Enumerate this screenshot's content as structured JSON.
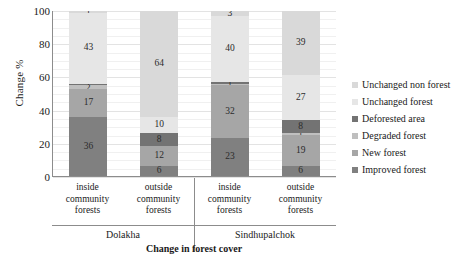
{
  "chart_data": {
    "type": "bar",
    "title": "",
    "xlabel": "Change in forest cover",
    "ylabel": "Change %",
    "ylim": [
      0,
      100
    ],
    "yticks": [
      0,
      20,
      40,
      60,
      80,
      100
    ],
    "grid": true,
    "stacked": true,
    "legend_position": "right",
    "categories": [
      "inside community forests",
      "outside community forests",
      "inside community forests",
      "outside community forests"
    ],
    "category_lines": [
      [
        "inside",
        "community",
        "forests"
      ],
      [
        "outside",
        "community",
        "forests"
      ],
      [
        "inside",
        "community",
        "forests"
      ],
      [
        "outside",
        "community",
        "forests"
      ]
    ],
    "groups": [
      {
        "label": "Dolakha",
        "span": 2
      },
      {
        "label": "Sindhupalchok",
        "span": 2
      }
    ],
    "series": [
      {
        "name": "Improved forest",
        "color": "#808080",
        "values": [
          36,
          6,
          23,
          6
        ]
      },
      {
        "name": "New forest",
        "color": "#a6a6a6",
        "values": [
          17,
          12,
          32,
          19
        ]
      },
      {
        "name": "Degraded forest",
        "color": "#bfbfbf",
        "values": [
          2,
          0,
          1,
          1
        ]
      },
      {
        "name": "Deforested area",
        "color": "#737373",
        "values": [
          1,
          8,
          1,
          8
        ]
      },
      {
        "name": "Unchanged forest",
        "color": "#e6e6e6",
        "values": [
          43,
          10,
          40,
          27
        ]
      },
      {
        "name": "Unchanged non forest",
        "color": "#d9d9d9",
        "values": [
          1,
          64,
          3,
          39
        ]
      }
    ],
    "legend_order": [
      "Unchanged non forest",
      "Unchanged forest",
      "Deforested area",
      "Degraded forest",
      "New forest",
      "Improved forest"
    ]
  },
  "yticks_text": [
    "100",
    "80",
    "60",
    "40",
    "20",
    "0"
  ],
  "legend": [
    {
      "label": "Unchanged non forest",
      "color": "#d9d9d9"
    },
    {
      "label": "Unchanged forest",
      "color": "#e6e6e6"
    },
    {
      "label": "Deforested area",
      "color": "#737373"
    },
    {
      "label": "Degraded forest",
      "color": "#bfbfbf"
    },
    {
      "label": "New forest",
      "color": "#a6a6a6"
    },
    {
      "label": "Improved forest",
      "color": "#808080"
    }
  ]
}
